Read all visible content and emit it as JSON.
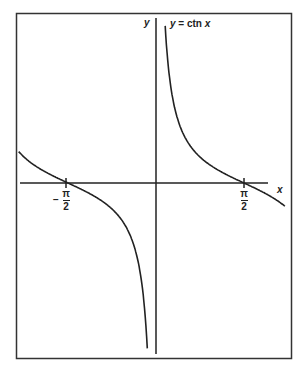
{
  "chart_data": {
    "type": "line",
    "title": "y = ctn x",
    "xlabel": "x",
    "ylabel": "y",
    "function": "cot(x)",
    "x_ticks": [
      {
        "value": -1.5708,
        "label_num": "π",
        "label_den": "2",
        "sign": "−"
      },
      {
        "value": 1.5708,
        "label_num": "π",
        "label_den": "2",
        "sign": ""
      }
    ],
    "asymptote_x": 0,
    "xlim": [
      -2.45,
      2.3
    ],
    "grid": false,
    "legend": null
  },
  "labels": {
    "title": "y = ctn x",
    "y_axis": "y",
    "x_axis": "x",
    "neg_sign": "−",
    "pi": "π",
    "two": "2"
  }
}
